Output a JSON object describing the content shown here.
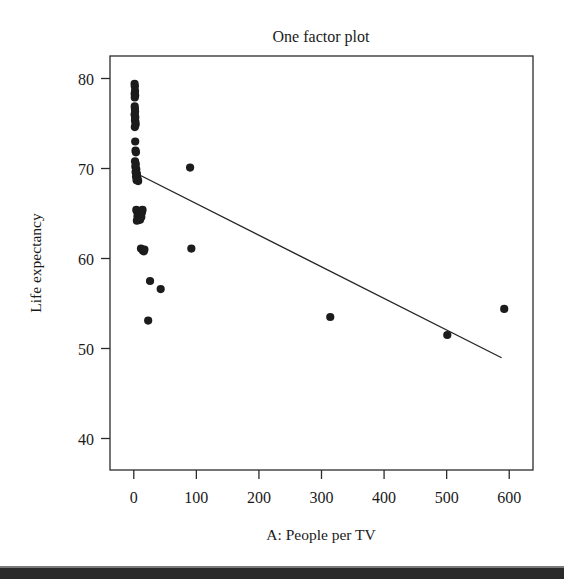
{
  "chart_data": {
    "type": "scatter",
    "title": "One factor plot",
    "xlabel": "A: People per TV",
    "ylabel": "Life expectancy",
    "xlim": [
      -38,
      638
    ],
    "ylim": [
      36.5,
      82.5
    ],
    "xticks": [
      0,
      100,
      200,
      300,
      400,
      500,
      600
    ],
    "yticks": [
      40,
      50,
      60,
      70,
      80
    ],
    "xtick_labels": [
      "0",
      "100",
      "200",
      "300",
      "400",
      "500",
      "600"
    ],
    "ytick_labels": [
      "40",
      "50",
      "60",
      "70",
      "80"
    ],
    "grid": false,
    "legend": null,
    "series": [
      {
        "name": "Life expectancy vs People per TV",
        "marker": "filled-circle",
        "color": "#1c1c1c",
        "points": [
          [
            1.3,
            79.4
          ],
          [
            1.7,
            79.1
          ],
          [
            2.0,
            78.6
          ],
          [
            1.4,
            78.3
          ],
          [
            2.2,
            78.1
          ],
          [
            1.6,
            77.9
          ],
          [
            1.5,
            76.9
          ],
          [
            1.8,
            76.6
          ],
          [
            2.1,
            76.3
          ],
          [
            1.3,
            76.0
          ],
          [
            2.4,
            75.7
          ],
          [
            1.9,
            75.4
          ],
          [
            2.6,
            75.2
          ],
          [
            3.0,
            74.9
          ],
          [
            1.7,
            74.6
          ],
          [
            2.3,
            73.0
          ],
          [
            2.8,
            72.0
          ],
          [
            3.4,
            71.8
          ],
          [
            2.0,
            70.8
          ],
          [
            3.2,
            70.5
          ],
          [
            2.5,
            70.2
          ],
          [
            4.0,
            69.9
          ],
          [
            2.9,
            69.6
          ],
          [
            5.0,
            69.4
          ],
          [
            3.6,
            69.1
          ],
          [
            6.0,
            68.9
          ],
          [
            4.5,
            68.7
          ],
          [
            7.0,
            68.6
          ],
          [
            90.0,
            70.1
          ],
          [
            4.0,
            65.4
          ],
          [
            5.5,
            65.2
          ],
          [
            7.0,
            65.0
          ],
          [
            9.0,
            64.9
          ],
          [
            11.0,
            65.3
          ],
          [
            13.0,
            65.1
          ],
          [
            6.0,
            64.7
          ],
          [
            8.0,
            64.5
          ],
          [
            10.0,
            64.3
          ],
          [
            12.0,
            64.6
          ],
          [
            5.0,
            64.2
          ],
          [
            14.0,
            65.4
          ],
          [
            11.5,
            61.1
          ],
          [
            14.5,
            60.9
          ],
          [
            17.0,
            61.0
          ],
          [
            16.0,
            60.8
          ],
          [
            92.0,
            61.1
          ],
          [
            26.0,
            57.5
          ],
          [
            43.0,
            56.6
          ],
          [
            23.0,
            53.1
          ],
          [
            314.0,
            53.5
          ],
          [
            501.0,
            51.5
          ],
          [
            592.0,
            54.4
          ]
        ]
      }
    ],
    "trend_line": {
      "name": "fitted regression line",
      "color": "#262626",
      "x_start": 3,
      "y_start": 69.5,
      "x_end": 587,
      "y_end": 49.0
    }
  }
}
